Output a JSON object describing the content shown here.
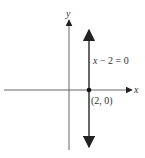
{
  "figure": {
    "axes": {
      "x_label": "x",
      "y_label": "y",
      "axis_color": "#555555"
    },
    "line": {
      "equation_var": "x",
      "equation_rest": " − 2 = 0",
      "equation_full": "x − 2 = 0",
      "color": "#444444"
    },
    "point": {
      "label": "(2, 0)",
      "x": 2,
      "y": 0,
      "color": "#111111"
    }
  }
}
